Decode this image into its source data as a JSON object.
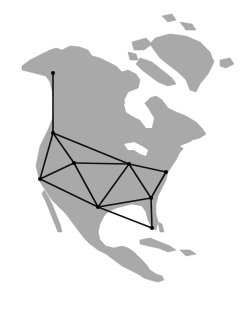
{
  "map": {
    "title": "",
    "region": "North America",
    "colors": {
      "land": "#a9a9a9",
      "water": "#ffffff",
      "edge": "#111111",
      "node": "#000000"
    },
    "nodes": [
      {
        "id": "alaska",
        "x": 53,
        "y": 73
      },
      {
        "id": "northwest",
        "x": 53,
        "y": 133
      },
      {
        "id": "west-coast",
        "x": 40,
        "y": 179
      },
      {
        "id": "mountain",
        "x": 74,
        "y": 163
      },
      {
        "id": "great-lakes",
        "x": 129,
        "y": 164
      },
      {
        "id": "northeast",
        "x": 166,
        "y": 172
      },
      {
        "id": "southeast",
        "x": 151,
        "y": 198
      },
      {
        "id": "gulf",
        "x": 98,
        "y": 207
      },
      {
        "id": "florida",
        "x": 152,
        "y": 228
      }
    ],
    "edges": [
      [
        "alaska",
        "northwest"
      ],
      [
        "northwest",
        "west-coast"
      ],
      [
        "northwest",
        "mountain"
      ],
      [
        "northwest",
        "great-lakes"
      ],
      [
        "west-coast",
        "mountain"
      ],
      [
        "west-coast",
        "gulf"
      ],
      [
        "mountain",
        "great-lakes"
      ],
      [
        "mountain",
        "gulf"
      ],
      [
        "great-lakes",
        "gulf"
      ],
      [
        "great-lakes",
        "northeast"
      ],
      [
        "great-lakes",
        "southeast"
      ],
      [
        "northeast",
        "southeast"
      ],
      [
        "gulf",
        "southeast"
      ],
      [
        "gulf",
        "florida"
      ],
      [
        "southeast",
        "florida"
      ]
    ]
  }
}
